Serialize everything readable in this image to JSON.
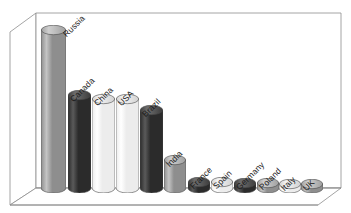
{
  "chart_data": {
    "type": "bar",
    "title": "",
    "subtitle": "",
    "xlabel": "",
    "ylabel": "",
    "grid": false,
    "legend": "none",
    "style": "3d-cylinder",
    "ylim": [
      0,
      100
    ],
    "categories": [
      "Russia",
      "Canada",
      "China",
      "USA",
      "Brazil",
      "India",
      "France",
      "Spain",
      "Germany",
      "Poland",
      "Italy",
      "UK"
    ],
    "values": [
      100,
      58,
      56,
      56,
      49,
      17,
      3,
      3,
      2.5,
      2,
      1.5,
      1
    ],
    "tick_labels": [],
    "annotations": [],
    "series": [
      {
        "name": "",
        "values": [
          100,
          58,
          56,
          56,
          49,
          17,
          3,
          3,
          2.5,
          2,
          1.5,
          1
        ]
      }
    ]
  },
  "bars": [
    {
      "label": "Russia",
      "x": 41,
      "w": 25,
      "top": 30,
      "tone": "medium"
    },
    {
      "label": "Canada",
      "x": 68,
      "w": 23,
      "top": 95,
      "tone": "dark"
    },
    {
      "label": "China",
      "x": 92,
      "w": 23,
      "top": 99,
      "tone": "light"
    },
    {
      "label": "USA",
      "x": 116,
      "w": 23,
      "top": 99,
      "tone": "light"
    },
    {
      "label": "Brazil",
      "x": 140,
      "w": 23,
      "top": 110,
      "tone": "dark"
    },
    {
      "label": "India",
      "x": 164,
      "w": 22,
      "top": 160,
      "tone": "medium"
    },
    {
      "label": "France",
      "x": 188,
      "w": 22,
      "top": 182,
      "tone": "dark"
    },
    {
      "label": "Spain",
      "x": 211,
      "w": 22,
      "top": 182,
      "tone": "light"
    },
    {
      "label": "Germany",
      "x": 234,
      "w": 22,
      "top": 183,
      "tone": "dark"
    },
    {
      "label": "Poland",
      "x": 257,
      "w": 22,
      "top": 183,
      "tone": "medium"
    },
    {
      "label": "Italy",
      "x": 279,
      "w": 22,
      "top": 184,
      "tone": "light"
    },
    {
      "label": "UK",
      "x": 301,
      "w": 22,
      "top": 184,
      "tone": "medium"
    }
  ],
  "labels": [
    {
      "text": "Russia",
      "lx": 68,
      "ly": 29
    },
    {
      "text": "Canada",
      "lx": 75,
      "ly": 94
    },
    {
      "text": "China",
      "lx": 99,
      "ly": 98
    },
    {
      "text": "USA",
      "lx": 123,
      "ly": 98
    },
    {
      "text": "Brazil",
      "lx": 147,
      "ly": 109
    },
    {
      "text": "India",
      "lx": 171,
      "ly": 159
    },
    {
      "text": "France",
      "lx": 195,
      "ly": 181
    },
    {
      "text": "Spain",
      "lx": 218,
      "ly": 181
    },
    {
      "text": "Germany",
      "lx": 241,
      "ly": 182
    },
    {
      "text": "Poland",
      "lx": 264,
      "ly": 182
    },
    {
      "text": "Italy",
      "lx": 286,
      "ly": 183
    },
    {
      "text": "UK",
      "lx": 308,
      "ly": 183
    }
  ],
  "colors": {
    "dark": "#2b2b2b",
    "dark_hi": "#5a5a5a",
    "light": "#ececec",
    "light_hi": "#ffffff",
    "medium": "#8e8e8e",
    "medium_hi": "#c4c4c4",
    "frame_line": "#8d8d8d",
    "wall": "#ffffff",
    "floor": "#ffffff",
    "text": "#1a1a1a"
  },
  "frame": {
    "outer_top_left": "10,32",
    "outer_bottom_left": "10,196",
    "back_top_left": "36,13",
    "back_top_right": "341,13",
    "back_bottom_left": "36,188",
    "front_bottom_right": "318,205"
  }
}
